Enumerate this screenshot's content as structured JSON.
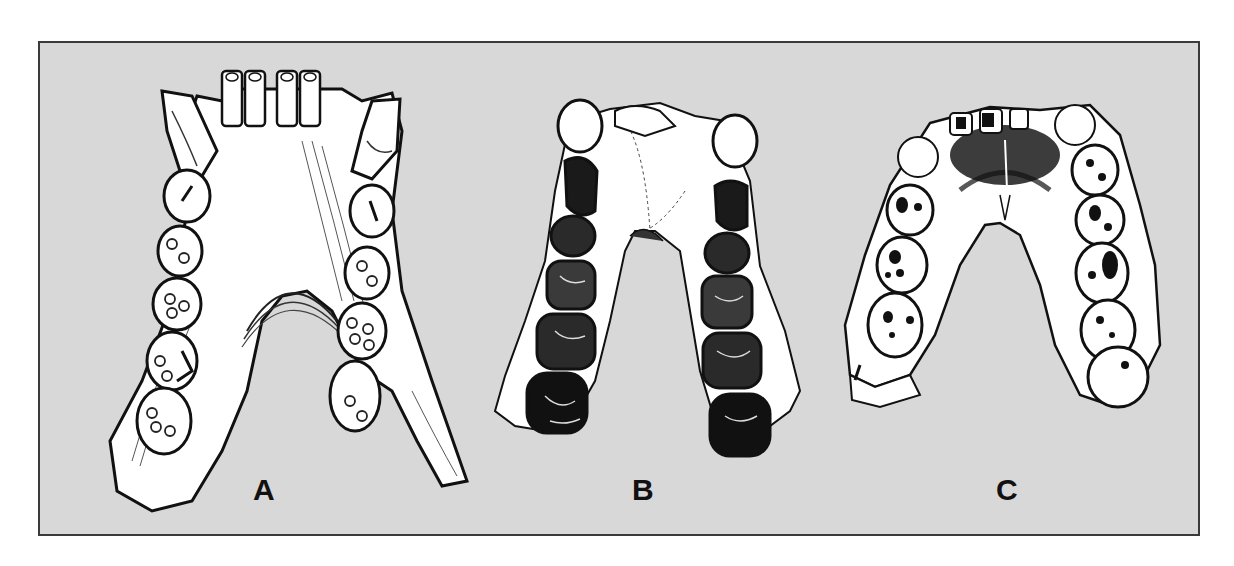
{
  "figure": {
    "background_color": "#d8d8d8",
    "border_color": "#3a3a3a",
    "panels": [
      {
        "id": "A",
        "label": "A",
        "subject": "mandible with V-shaped dental arcade, incisors and canines at front, molars along diverging rami"
      },
      {
        "id": "B",
        "label": "B",
        "subject": "U-shaped dental arcade with large dark-rendered molars"
      },
      {
        "id": "C",
        "label": "C",
        "subject": "parabolic dental arcade with shaded palate and outlined molars"
      }
    ]
  }
}
